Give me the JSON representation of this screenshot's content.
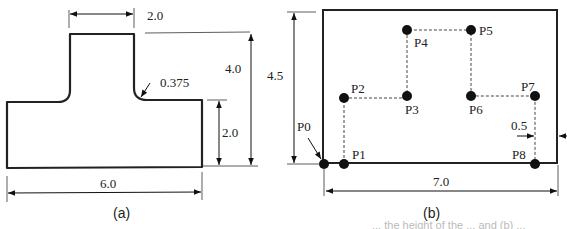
{
  "figure_a": {
    "caption": "(a)",
    "dimensions": {
      "stem_width": "2.0",
      "total_height": "4.0",
      "base_height": "2.0",
      "base_width": "6.0",
      "fillet_radius": "0.375"
    },
    "cut_label": "4."
  },
  "figure_b": {
    "caption": "(b)",
    "dimensions": {
      "height": "4.5",
      "width": "7.0",
      "offset": "0.5"
    },
    "points": [
      {
        "label": "P0"
      },
      {
        "label": "P1"
      },
      {
        "label": "P2"
      },
      {
        "label": "P3"
      },
      {
        "label": "P4"
      },
      {
        "label": "P5"
      },
      {
        "label": "P6"
      },
      {
        "label": "P7"
      },
      {
        "label": "P8"
      }
    ]
  },
  "footer": {
    "truncated_caption": "... the height of the ... and (b) ..."
  }
}
